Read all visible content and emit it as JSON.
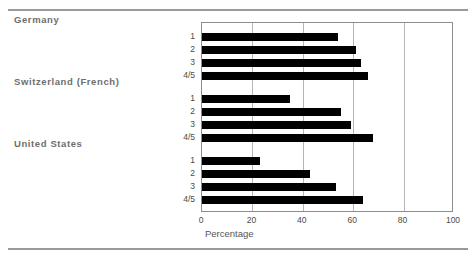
{
  "chart_data": {
    "type": "bar",
    "orientation": "horizontal",
    "title": "",
    "xlabel": "Percentage",
    "ylabel": "",
    "xlim": [
      0,
      100
    ],
    "xticks": [
      0,
      20,
      40,
      60,
      80,
      100
    ],
    "grid": true,
    "legend": false,
    "categories": [
      "1",
      "2",
      "3",
      "4/5"
    ],
    "groups": [
      {
        "name": "Germany",
        "categories": [
          "1",
          "2",
          "3",
          "4/5"
        ],
        "values": [
          54,
          61,
          63,
          66
        ]
      },
      {
        "name": "Switzerland (French)",
        "categories": [
          "1",
          "2",
          "3",
          "4/5"
        ],
        "values": [
          35,
          55,
          59,
          68
        ]
      },
      {
        "name": "United States",
        "categories": [
          "1",
          "2",
          "3",
          "4/5"
        ],
        "values": [
          23,
          43,
          53,
          64
        ]
      }
    ],
    "series": [
      {
        "name": "Germany 1",
        "value": 54
      },
      {
        "name": "Germany 2",
        "value": 61
      },
      {
        "name": "Germany 3",
        "value": 63
      },
      {
        "name": "Germany 4/5",
        "value": 66
      },
      {
        "name": "Switzerland (French) 1",
        "value": 35
      },
      {
        "name": "Switzerland (French) 2",
        "value": 55
      },
      {
        "name": "Switzerland (French) 3",
        "value": 59
      },
      {
        "name": "Switzerland (French) 4/5",
        "value": 68
      },
      {
        "name": "United States 1",
        "value": 23
      },
      {
        "name": "United States 2",
        "value": 43
      },
      {
        "name": "United States 3",
        "value": 53
      },
      {
        "name": "United States 4/5",
        "value": 64
      }
    ],
    "colors": {
      "bar": "#000000",
      "grid": "#b5b5b5",
      "frame": "#8d8d8d",
      "rule": "#9a9a9a",
      "group_label": "#6e6e6e",
      "tick_label": "#4a4a4a"
    }
  }
}
